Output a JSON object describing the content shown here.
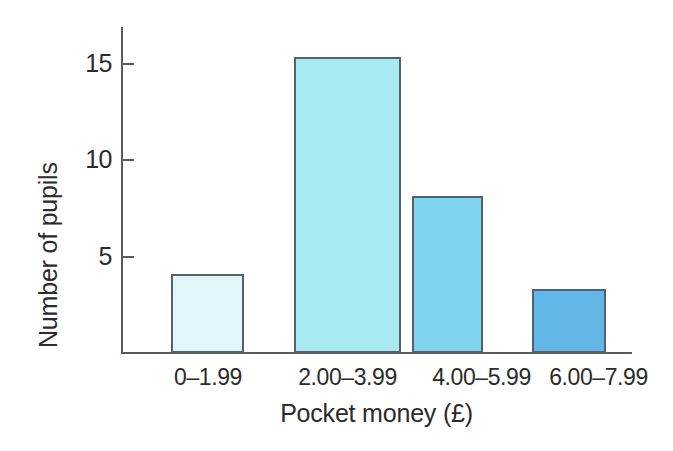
{
  "chart_data": {
    "type": "bar",
    "title": "",
    "xlabel": "Pocket money (£)",
    "ylabel": "Number of pupils",
    "categories": [
      "0–1.99",
      "2.00–3.99",
      "4.00–5.99",
      "6.00–7.99"
    ],
    "values": [
      4.1,
      15.3,
      8.1,
      3.3
    ],
    "ytick_labels": [
      "5",
      "10",
      "15"
    ],
    "ytick_values": [
      5,
      10,
      15
    ],
    "ylim": [
      0,
      17
    ],
    "grid": false,
    "legend": null,
    "bar_colors": [
      "#e2f5f8",
      "#a9eaf1",
      "#7fd3ef",
      "#63b7e8"
    ],
    "bar_border_color": "#56606b",
    "axis_color": "#575c5f",
    "text_color": "#2b2b2b",
    "background": "#ffffff"
  },
  "axes": {
    "y_title": "Number of pupils",
    "x_title": "Pocket money (£)",
    "ticks": [
      {
        "label": "15",
        "value": 15
      },
      {
        "label": "10",
        "value": 10
      },
      {
        "label": "5",
        "value": 5
      }
    ]
  },
  "bars": [
    {
      "label": "0–1.99",
      "value": 4.1,
      "color": "#e2f5f8"
    },
    {
      "label": "2.00–3.99",
      "value": 15.3,
      "color": "#a9eaf1"
    },
    {
      "label": "4.00–5.99",
      "value": 8.1,
      "color": "#7fd3ef"
    },
    {
      "label": "6.00–7.99",
      "value": 3.3,
      "color": "#63b7e8"
    }
  ]
}
